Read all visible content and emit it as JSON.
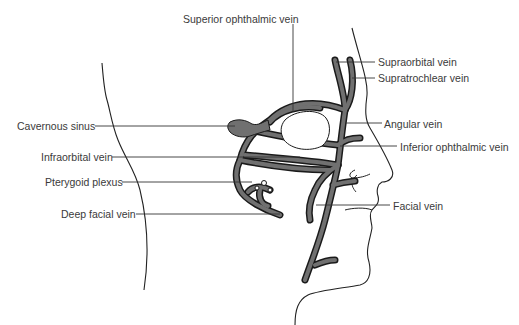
{
  "diagram": {
    "type": "anatomical illustration",
    "colors": {
      "vein_fill": "#707070",
      "vein_outline": "#1a1a1a",
      "line": "#333333",
      "background": "#ffffff"
    },
    "labels": {
      "superior_ophthalmic_vein": "Superior ophthalmic vein",
      "supraorbital_vein": "Supraorbital vein",
      "supratrochlear_vein": "Supratrochlear vein",
      "cavernous_sinus": "Cavernous sinus",
      "angular_vein": "Angular vein",
      "infraorbital_vein": "Infraorbital vein",
      "inferior_ophthalmic_vein": "Inferior ophthalmic vein",
      "pterygoid_plexus": "Pterygoid plexus",
      "deep_facial_vein": "Deep facial vein",
      "facial_vein": "Facial vein"
    }
  }
}
